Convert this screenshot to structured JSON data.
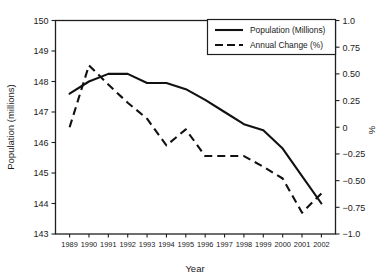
{
  "chart_data": {
    "type": "line",
    "title": "",
    "xlabel": "Year",
    "ylabel": "Population (millions)",
    "y2label": "%",
    "grid": false,
    "legend_position": "top-right",
    "x": [
      1989,
      1990,
      1991,
      1992,
      1993,
      1994,
      1995,
      1996,
      1997,
      1998,
      1999,
      2000,
      2001,
      2002
    ],
    "categories": [
      "1989",
      "1990",
      "1991",
      "1992",
      "1993",
      "1994",
      "1995",
      "1996",
      "1997",
      "1998",
      "1999",
      "2000",
      "2001",
      "2002"
    ],
    "ylim": [
      143,
      150
    ],
    "yticks": [
      143,
      144,
      145,
      146,
      147,
      148,
      149,
      150
    ],
    "ytick_labels": [
      "143",
      "144",
      "145",
      "146",
      "147",
      "148",
      "149",
      "150"
    ],
    "y2lim": [
      -1.0,
      1.0
    ],
    "y2ticks": [
      -1.0,
      -0.75,
      -0.5,
      -0.25,
      0,
      0.25,
      0.5,
      0.75,
      1.0
    ],
    "y2tick_labels": [
      "−1.0",
      "−0.75",
      "−0.50",
      "−0.25",
      "0",
      "0.25",
      "0.50",
      "0.75",
      "1.0"
    ],
    "series": [
      {
        "name": "Population (Millions)",
        "axis": "left",
        "style": "solid",
        "values": [
          147.6,
          148.0,
          148.25,
          148.25,
          147.95,
          147.95,
          147.75,
          147.4,
          147.0,
          146.6,
          146.4,
          145.8,
          144.9,
          144.0
        ]
      },
      {
        "name": "Annual Change (%)",
        "axis": "right",
        "style": "dashed",
        "values": [
          0.0,
          0.58,
          0.4,
          0.23,
          0.08,
          -0.17,
          -0.02,
          -0.27,
          -0.27,
          -0.27,
          -0.37,
          -0.48,
          -0.8,
          -0.62
        ]
      }
    ],
    "legend": [
      {
        "label": "Population (Millions)",
        "style": "solid"
      },
      {
        "label": "Annual Change (%)",
        "style": "dashed"
      }
    ]
  },
  "colors": {
    "line": "#111111",
    "axis": "#1f1f1f",
    "background": "#ffffff"
  }
}
